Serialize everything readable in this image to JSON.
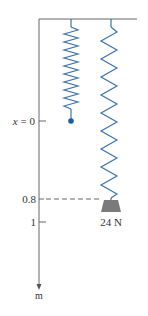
{
  "diagram": {
    "axis": {
      "zero_label_var": "x",
      "zero_label_eq": "= 0",
      "tick_08": "0.8",
      "tick_1": "1",
      "unit": "m"
    },
    "weight": {
      "label": "24 N"
    },
    "colors": {
      "spring": "#3a73b0",
      "frame": "#555555",
      "weight": "#7a7a7a",
      "dot": "#1e5c9e"
    }
  }
}
